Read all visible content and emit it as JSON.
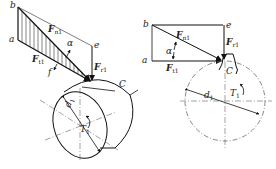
{
  "figure": {
    "caption": "",
    "caption_note": "Chinese caption, too faint/cropped to read reliably",
    "left_view": {
      "points": [
        "b",
        "a",
        "e",
        "f",
        "C"
      ],
      "forces": [
        {
          "symbol": "F",
          "sub": "n1",
          "label": "normal force"
        },
        {
          "symbol": "F",
          "sub": "t1",
          "label": "tangential force"
        },
        {
          "symbol": "F",
          "sub": "r1",
          "label": "radial force"
        }
      ],
      "angle": "α",
      "dimension": "d",
      "dimension_sub": "1",
      "torque": "T",
      "torque_sub": "1"
    },
    "right_view": {
      "points": [
        "b",
        "a",
        "e",
        "C"
      ],
      "forces": [
        {
          "symbol": "F",
          "sub": "n1"
        },
        {
          "symbol": "F",
          "sub": "t1"
        },
        {
          "symbol": "F",
          "sub": "r1"
        }
      ],
      "angle": "α",
      "dimension": "d",
      "dimension_sub": "1",
      "torque": "T",
      "torque_sub": "1"
    }
  }
}
